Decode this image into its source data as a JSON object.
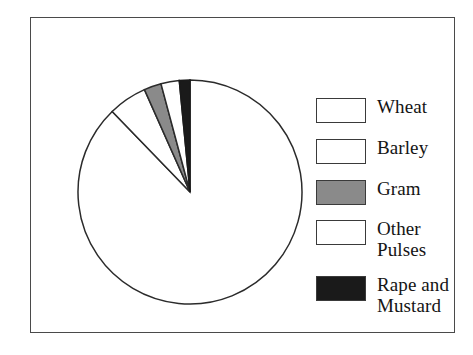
{
  "chart_data": {
    "type": "pie",
    "title": "",
    "subtitle": "",
    "categories": [
      "Wheat",
      "Barley",
      "Gram",
      "Other Pulses",
      "Rape and Mustard"
    ],
    "values": [
      87.8,
      2.6,
      2.5,
      5.6,
      1.5
    ],
    "unit": "percent",
    "start_angle_deg": 0,
    "direction": "clockwise",
    "legend_position": "right",
    "grid": false,
    "slices": [
      {
        "label": "Wheat",
        "value": 87.8,
        "start_deg": 0,
        "end_deg": 316,
        "fill": "#ffffff",
        "stroke": "#2b2b2b",
        "swatch_fill": "#ffffff"
      },
      {
        "label": "Other Pulses",
        "value": 5.6,
        "start_deg": 316,
        "end_deg": 336,
        "fill": "#ffffff",
        "stroke": "#2b2b2b",
        "swatch_fill": "#ffffff"
      },
      {
        "label": "Gram",
        "value": 2.5,
        "start_deg": 336,
        "end_deg": 345,
        "fill": "#8a8a8a",
        "stroke": "#2b2b2b",
        "swatch_fill": "#8a8a8a"
      },
      {
        "label": "Barley",
        "value": 2.6,
        "start_deg": 345,
        "end_deg": 354.5,
        "fill": "#ffffff",
        "stroke": "#2b2b2b",
        "swatch_fill": "#ffffff"
      },
      {
        "label": "Rape and Mustard",
        "value": 1.5,
        "start_deg": 354.5,
        "end_deg": 360,
        "fill": "#1a1a1a",
        "stroke": "#1a1a1a",
        "swatch_fill": "#1a1a1a"
      }
    ]
  },
  "legend": {
    "items": [
      {
        "label": "Wheat",
        "swatch": "#ffffff",
        "swatch_name": "legend-swatch-wheat"
      },
      {
        "label": "Barley",
        "swatch": "#ffffff",
        "swatch_name": "legend-swatch-barley"
      },
      {
        "label": "Gram",
        "swatch": "#8a8a8a",
        "swatch_name": "legend-swatch-gram"
      },
      {
        "label": "Other\nPulses",
        "swatch": "#ffffff",
        "swatch_name": "legend-swatch-other-pulses"
      },
      {
        "label": "Rape and\nMustard",
        "swatch": "#1a1a1a",
        "swatch_name": "legend-swatch-rape-and-mustard"
      }
    ]
  },
  "colors": {
    "frame_border": "#4a4a4a",
    "pie_outline": "#2b2b2b",
    "gray_fill": "#8a8a8a",
    "black_fill": "#1a1a1a",
    "white_fill": "#ffffff",
    "text": "#141414",
    "background": "#ffffff"
  }
}
